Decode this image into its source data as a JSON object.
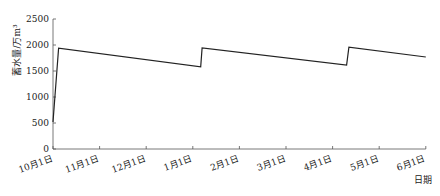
{
  "chart_data": {
    "type": "line",
    "title": "",
    "xlabel": "日期",
    "ylabel": "蓄水量/万m³",
    "ylim": [
      0,
      2500
    ],
    "yticks": [
      0,
      500,
      1000,
      1500,
      2000,
      2500
    ],
    "xticks": [
      "10月1日",
      "11月1日",
      "12月1日",
      "1月1日",
      "2月1日",
      "3月1日",
      "4月1日",
      "5月1日",
      "6月1日"
    ],
    "grid": false,
    "legend": null,
    "series": [
      {
        "name": "蓄水量",
        "color": "#222222",
        "points": [
          {
            "x": 0.0,
            "label": "10月1日",
            "y": 520
          },
          {
            "x": 0.12,
            "label": "10月4日",
            "y": 1940
          },
          {
            "x": 3.17,
            "label": "1月6日",
            "y": 1580
          },
          {
            "x": 3.2,
            "label": "1月7日",
            "y": 1945
          },
          {
            "x": 6.3,
            "label": "4月9日",
            "y": 1615
          },
          {
            "x": 6.35,
            "label": "4月10日",
            "y": 1960
          },
          {
            "x": 8.0,
            "label": "6月1日",
            "y": 1770
          }
        ]
      }
    ]
  }
}
